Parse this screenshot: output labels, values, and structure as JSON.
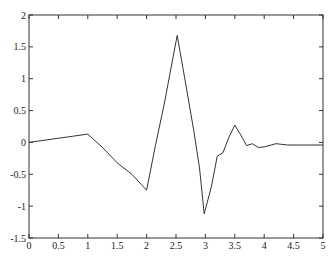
{
  "chart_data": {
    "type": "line",
    "title": "",
    "xlabel": "",
    "ylabel": "",
    "xlim": [
      0,
      5
    ],
    "ylim": [
      -1.5,
      2
    ],
    "grid": false,
    "legend": null,
    "x_ticks": [
      "0",
      "0.5",
      "1",
      "1.5",
      "2",
      "2.5",
      "3",
      "3.5",
      "4",
      "4.5",
      "5"
    ],
    "y_ticks": [
      "2",
      "1.5",
      "1",
      "0.5",
      "0",
      "-0.5",
      "-1",
      "-1.5"
    ],
    "series": [
      {
        "name": "signal",
        "color": "#333333",
        "x": [
          0,
          1.0,
          1.25,
          1.5,
          1.75,
          2.0,
          2.15,
          2.3,
          2.52,
          2.65,
          2.8,
          2.9,
          2.98,
          3.1,
          3.2,
          3.3,
          3.4,
          3.5,
          3.6,
          3.7,
          3.8,
          3.9,
          4.0,
          4.2,
          4.4,
          4.6,
          4.8,
          5.0
        ],
        "values": [
          0,
          0.13,
          -0.08,
          -0.32,
          -0.5,
          -0.75,
          -0.05,
          0.6,
          1.68,
          1.0,
          0.2,
          -0.4,
          -1.12,
          -0.7,
          -0.22,
          -0.16,
          0.08,
          0.27,
          0.12,
          -0.05,
          -0.02,
          -0.08,
          -0.07,
          -0.02,
          -0.04,
          -0.04,
          -0.04,
          -0.04
        ]
      }
    ]
  }
}
